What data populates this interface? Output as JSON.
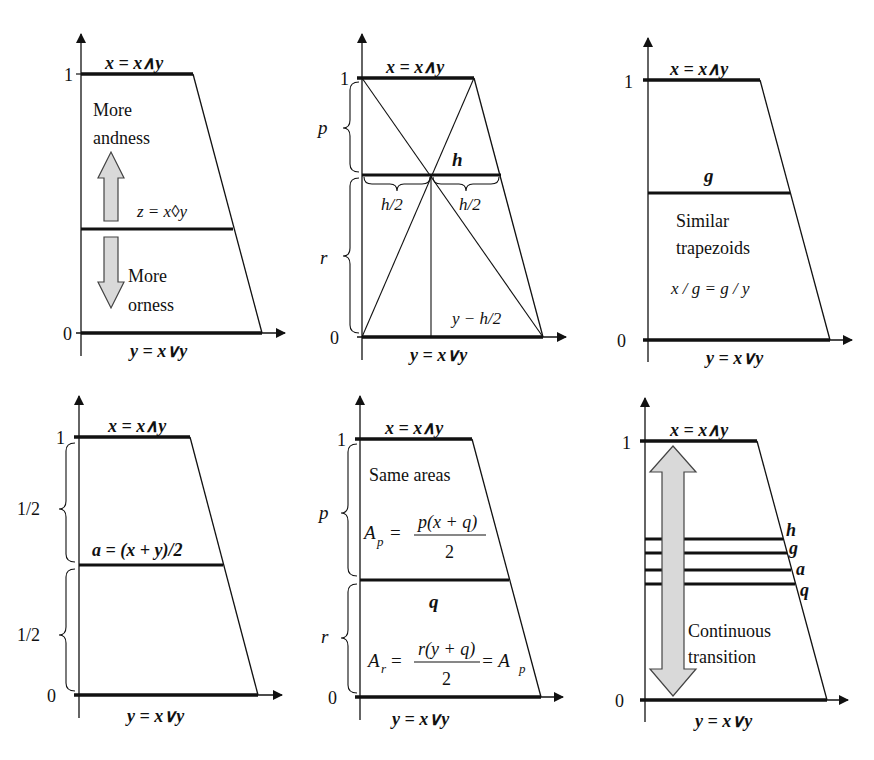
{
  "figure": {
    "common": {
      "top_label": "x = x∧y",
      "bottom_label": "y = x∨y",
      "tick_one": "1",
      "tick_zero": "0"
    },
    "panels": [
      {
        "id": "p1",
        "mid_label": "z = x◊y",
        "upper_text": [
          "More",
          "andness"
        ],
        "lower_text": [
          "More",
          "orness"
        ]
      },
      {
        "id": "p2",
        "mid_label": "h",
        "brace_upper": "p",
        "brace_lower": "r",
        "half_left": "h/2",
        "half_right": "h/2",
        "corner_label": "y − h/2"
      },
      {
        "id": "p3",
        "mid_label": "g",
        "text": [
          "Similar",
          "trapezoids"
        ],
        "equation": "x / g = g / y"
      },
      {
        "id": "p4",
        "mid_label": "a = (x + y)/2",
        "brace_upper": "1/2",
        "brace_lower": "1/2"
      },
      {
        "id": "p5",
        "mid_label": "q",
        "brace_upper": "p",
        "brace_lower": "r",
        "text": "Same areas",
        "eq_upper_lhs": "A",
        "eq_upper_sub": "p",
        "eq_upper_num": "p(x + q)",
        "eq_upper_den": "2",
        "eq_lower_lhs": "A",
        "eq_lower_sub": "r",
        "eq_lower_num": "r(y + q)",
        "eq_lower_den": "2",
        "eq_lower_rhs": "= A",
        "eq_lower_rhs_sub": "p"
      },
      {
        "id": "p6",
        "levels": [
          "h",
          "g",
          "a",
          "q"
        ],
        "text": [
          "Continuous",
          "transition"
        ]
      }
    ],
    "colors": {
      "line": "#111111",
      "arrow_fill": "#d9d9d9",
      "arrow_stroke": "#444444"
    }
  }
}
